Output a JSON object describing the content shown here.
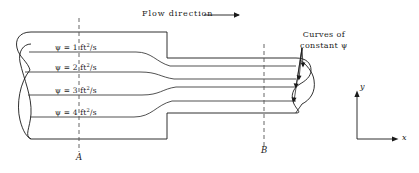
{
  "figure": {
    "title_top": "Flow direction",
    "flow_arrow_icon": "right-arrow-icon",
    "psi_symbol": "ψ",
    "streamline_labels": [
      {
        "id": "psi-1",
        "text": "ψ = 1 ft",
        "exponent": "2",
        "unit_tail": "/s",
        "value": 1
      },
      {
        "id": "psi-2",
        "text": "ψ = 2 ft",
        "exponent": "2",
        "unit_tail": "/s",
        "value": 2
      },
      {
        "id": "psi-3",
        "text": "ψ = 3 ft",
        "exponent": "2",
        "unit_tail": "/s",
        "value": 3
      },
      {
        "id": "psi-4",
        "text": "ψ = 4 ft",
        "exponent": "2",
        "unit_tail": "/s",
        "value": 4
      }
    ],
    "annotation": {
      "line1": "Curves of",
      "line2": "constant ψ"
    },
    "sections": [
      {
        "id": "section-a",
        "label": "A"
      },
      {
        "id": "section-b",
        "label": "B"
      }
    ],
    "axes": {
      "x_label": "x",
      "y_label": "y"
    },
    "colors": {
      "stroke": "#1a1a1a",
      "background": "#ffffff",
      "dashed": "#555555"
    }
  }
}
